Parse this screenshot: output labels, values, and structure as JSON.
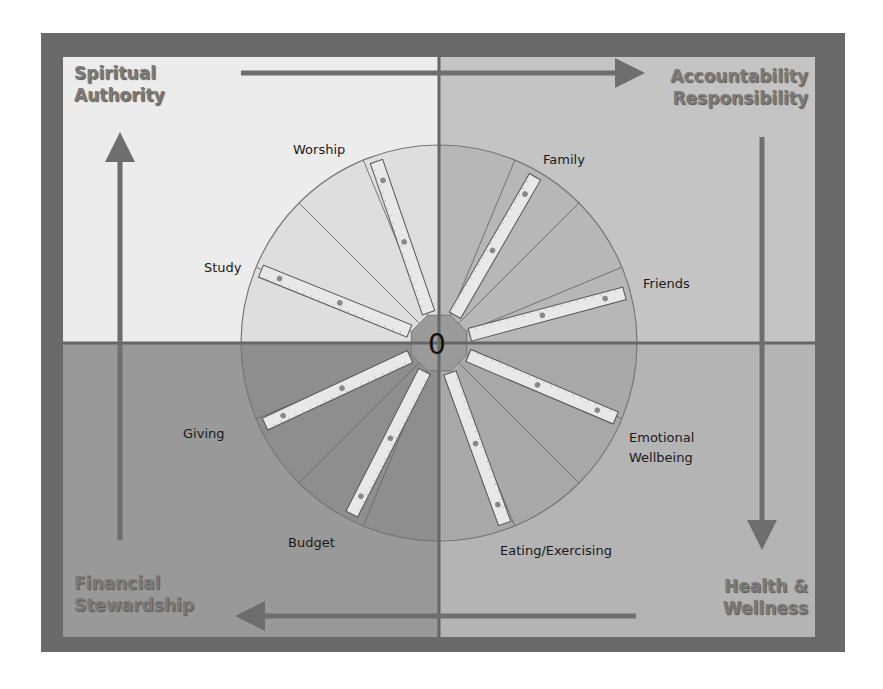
{
  "corners": {
    "top_left": [
      "Spiritual",
      "Authority"
    ],
    "top_right": [
      "Accountability",
      "Responsibility"
    ],
    "bottom_left": [
      "Financial",
      "Stewardship"
    ],
    "bottom_right": [
      "Health &",
      "Wellness"
    ]
  },
  "center_label": "0",
  "categories": [
    {
      "id": "worship",
      "label": [
        "Worship"
      ]
    },
    {
      "id": "family",
      "label": [
        "Family"
      ]
    },
    {
      "id": "friends",
      "label": [
        "Friends"
      ]
    },
    {
      "id": "emotional",
      "label": [
        "Emotional",
        "Wellbeing"
      ]
    },
    {
      "id": "eating",
      "label": [
        "Eating/Exercising"
      ]
    },
    {
      "id": "budget",
      "label": [
        "Budget"
      ]
    },
    {
      "id": "giving",
      "label": [
        "Giving"
      ]
    },
    {
      "id": "study",
      "label": [
        "Study"
      ]
    }
  ],
  "colors": {
    "frame": "#6a6a6a",
    "quadrant_top_left": "#ececec",
    "quadrant_top_right": "#c4c4c4",
    "quadrant_bottom_left": "#999999",
    "quadrant_bottom_right": "#b4b4b4",
    "axis": "#666666",
    "ruler": "#e6e6e6",
    "corner_text": "#7a7a7a"
  },
  "flow_arrows": [
    {
      "from": "Spiritual Authority",
      "to": "Accountability Responsibility",
      "direction": "right"
    },
    {
      "from": "Accountability Responsibility",
      "to": "Health & Wellness",
      "direction": "down"
    },
    {
      "from": "Health & Wellness",
      "to": "Financial Stewardship",
      "direction": "left"
    },
    {
      "from": "Financial Stewardship",
      "to": "Spiritual Authority",
      "direction": "up"
    }
  ]
}
